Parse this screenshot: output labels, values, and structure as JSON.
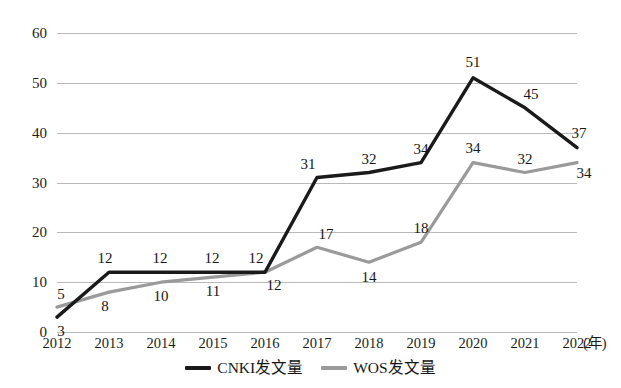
{
  "chart_data": {
    "type": "line",
    "title": "",
    "xlabel": "(年)",
    "ylabel": "",
    "categories": [
      "2012",
      "2013",
      "2014",
      "2015",
      "2016",
      "2017",
      "2018",
      "2019",
      "2020",
      "2021",
      "2022"
    ],
    "ylim": [
      0,
      60
    ],
    "yticks": [
      0,
      10,
      20,
      30,
      40,
      50,
      60
    ],
    "grid": true,
    "legend_position": "bottom-center",
    "series": [
      {
        "name": "CNKI发文量",
        "color": "#1a1a1a",
        "values": [
          3,
          12,
          12,
          12,
          12,
          31,
          32,
          34,
          51,
          45,
          37
        ],
        "labels": [
          "3",
          "12",
          "12",
          "12",
          "12",
          "31",
          "32",
          "34",
          "51",
          "45",
          "37"
        ]
      },
      {
        "name": "WOS发文量",
        "color": "#9a9a9a",
        "values": [
          5,
          8,
          10,
          11,
          12,
          17,
          14,
          18,
          34,
          32,
          34
        ],
        "labels": [
          "5",
          "8",
          "10",
          "11",
          "12",
          "17",
          "14",
          "18",
          "34",
          "32",
          "34"
        ]
      }
    ]
  },
  "axis": {
    "y_tick_labels": [
      "60",
      "50",
      "40",
      "30",
      "20",
      "10",
      "0"
    ],
    "x_tick_labels": [
      "2012",
      "2013",
      "2014",
      "2015",
      "2016",
      "2017",
      "2018",
      "2019",
      "2020",
      "2021",
      "2022"
    ],
    "x_unit": "(年)"
  },
  "legend": {
    "items": [
      {
        "label": "CNKI发文量",
        "color": "#1a1a1a"
      },
      {
        "label": "WOS发文量",
        "color": "#9a9a9a"
      }
    ]
  }
}
